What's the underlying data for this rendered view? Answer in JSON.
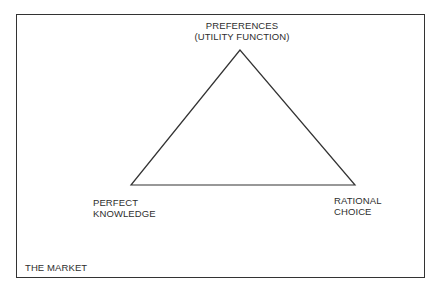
{
  "diagram": {
    "frame_label": "THE MARKET",
    "vertices": {
      "top": {
        "lines": [
          "PREFERENCES",
          "(UTILITY FUNCTION)"
        ]
      },
      "bottom_left": {
        "lines": [
          "PERFECT",
          "KNOWLEDGE"
        ]
      },
      "bottom_right": {
        "lines": [
          "RATIONAL",
          "CHOICE"
        ]
      }
    },
    "shape": "triangle",
    "colors": {
      "line": "#333333",
      "text": "#2e2e2e",
      "background": "#ffffff"
    }
  }
}
